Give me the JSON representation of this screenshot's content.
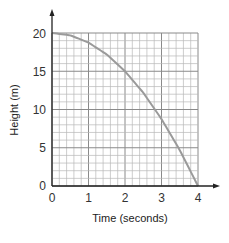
{
  "chart_data": {
    "type": "line",
    "title": "",
    "xlabel": "Time (seconds)",
    "ylabel": "Height (m)",
    "xlim": [
      0,
      4
    ],
    "ylim": [
      0,
      20
    ],
    "x_ticks": [
      "0",
      "1",
      "2",
      "3",
      "4"
    ],
    "y_ticks": [
      "0",
      "5",
      "10",
      "15",
      "20"
    ],
    "grid": true,
    "grid_minor_x_step": 0.2,
    "grid_minor_y_step": 1,
    "legend": null,
    "series": [
      {
        "name": "Height",
        "x": [
          0,
          0.5,
          1,
          1.5,
          2,
          2.5,
          3,
          3.5,
          4
        ],
        "values": [
          20,
          19.7,
          18.75,
          17.2,
          15,
          12.2,
          8.75,
          4.7,
          0
        ]
      }
    ],
    "colors": {
      "curve": "#9a9a9a",
      "grid": "#b8b8b8",
      "axis": "#222222"
    }
  }
}
